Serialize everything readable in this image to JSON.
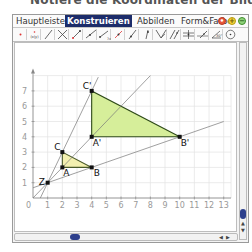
{
  "instruction": "Notiere die Koordinaten der Bildpunkte.",
  "window": {
    "tabs": [
      {
        "label": "Hauptleiste",
        "active": false
      },
      {
        "label": "Konstruieren",
        "active": true
      },
      {
        "label": "Abbilden",
        "active": false
      },
      {
        "label": "Form&Farbe",
        "active": false
      }
    ],
    "controls": {
      "close": "close-icon",
      "zoom_in": "plus-icon",
      "zoom_out": "minus-icon",
      "colors": {
        "close": "#e8573a",
        "zoom_in": "#e3c21a",
        "zoom_out": "#4fae3a"
      }
    },
    "toolbar": [
      {
        "name": "point-tool",
        "icon": "point-icon"
      },
      {
        "name": "coordinate-point-tool",
        "icon": "coordinates-icon",
        "label": "(x|y)"
      },
      {
        "name": "line-tool",
        "icon": "line-icon"
      },
      {
        "name": "intersection-tool",
        "icon": "intersection-icon"
      },
      {
        "name": "segment-tool",
        "icon": "segment-icon"
      },
      {
        "name": "ray-tool",
        "icon": "ray-icon"
      },
      {
        "name": "segment-length-tool",
        "icon": "segment-length-icon"
      },
      {
        "name": "midpoint-tool",
        "icon": "midpoint-icon"
      },
      {
        "name": "point-on-line-tool",
        "icon": "point-on-line-icon"
      },
      {
        "name": "perpendicular-tool",
        "icon": "perpendicular-icon"
      },
      {
        "name": "angle-bisector-tool",
        "icon": "angle-bisector-icon"
      },
      {
        "name": "parallel-tool",
        "icon": "parallel-icon"
      },
      {
        "name": "symmetry-tool",
        "icon": "symmetry-icon"
      },
      {
        "name": "vector-tool",
        "icon": "vector-icon"
      },
      {
        "name": "angle-tool",
        "icon": "angle-icon"
      },
      {
        "name": "circle-tool",
        "icon": "circle-icon"
      }
    ]
  },
  "chart_data": {
    "type": "scatter",
    "title": "",
    "xlabel": "",
    "ylabel": "",
    "xlim": [
      0,
      13.5
    ],
    "ylim": [
      0,
      8
    ],
    "grid": true,
    "x_ticks": [
      "0",
      "1",
      "2",
      "3",
      "4",
      "5",
      "6",
      "7",
      "8",
      "9",
      "10",
      "11",
      "12",
      "13"
    ],
    "y_ticks": [
      "1",
      "2",
      "3",
      "4",
      "5",
      "6",
      "7"
    ],
    "points": [
      {
        "label": "Z",
        "x": 1,
        "y": 1
      },
      {
        "label": "A",
        "x": 2,
        "y": 2
      },
      {
        "label": "B",
        "x": 4,
        "y": 2
      },
      {
        "label": "C",
        "x": 2,
        "y": 3
      },
      {
        "label": "A'",
        "x": 4,
        "y": 4
      },
      {
        "label": "B'",
        "x": 10,
        "y": 4
      },
      {
        "label": "C'",
        "x": 4,
        "y": 7
      }
    ],
    "polygons": [
      {
        "name": "ABC",
        "vertices": [
          "A",
          "B",
          "C"
        ],
        "fill": "#f3f0b0",
        "stroke": "#4a5a2a"
      },
      {
        "name": "A'B'C'",
        "vertices": [
          "A'",
          "B'",
          "C'"
        ],
        "fill": "#d6ee9a",
        "stroke": "#2e4a18"
      }
    ],
    "lines": [
      {
        "through": [
          "Z",
          "C'"
        ],
        "from": [
          0.5,
          0
        ],
        "to": [
          4.45,
          7.9
        ]
      },
      {
        "through": [
          "Z",
          "A'"
        ],
        "from": [
          0,
          0
        ],
        "to": [
          8,
          8
        ]
      },
      {
        "through": [
          "Z",
          "B'"
        ],
        "from": [
          0,
          0.667
        ],
        "to": [
          13,
          5
        ]
      }
    ]
  }
}
